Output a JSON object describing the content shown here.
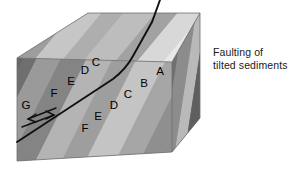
{
  "figure": {
    "kind": "geologic-block-diagram",
    "caption_line_1": "Faulting of",
    "caption_line_2": "tilted sediments",
    "background_color": "#ffffff"
  },
  "block": {
    "top_face_label": "top-face",
    "front_face_label": "front-face",
    "right_face_label": "right-face",
    "outline_color": "#6d6d6d"
  },
  "fault": {
    "line_color": "#111111",
    "arrow_color": "#111111",
    "upper_arrow_direction": "left",
    "lower_arrow_direction": "right"
  },
  "strata_labels": {
    "hanging_wall": [
      {
        "id": "label-c-top",
        "text": "C",
        "x": 96,
        "y": 66
      },
      {
        "id": "label-d-top",
        "text": "D",
        "x": 85,
        "y": 72
      },
      {
        "id": "label-e-top",
        "text": "E",
        "x": 71,
        "y": 83
      },
      {
        "id": "label-f-top",
        "text": "F",
        "x": 54,
        "y": 95
      },
      {
        "id": "label-g-top",
        "text": "G",
        "x": 26,
        "y": 108
      }
    ],
    "footwall": [
      {
        "id": "label-a",
        "text": "A",
        "x": 160,
        "y": 73
      },
      {
        "id": "label-b",
        "text": "B",
        "x": 144,
        "y": 85
      },
      {
        "id": "label-c-low",
        "text": "C",
        "x": 128,
        "y": 96
      },
      {
        "id": "label-d-low",
        "text": "D",
        "x": 114,
        "y": 106
      },
      {
        "id": "label-e-low",
        "text": "E",
        "x": 98,
        "y": 117
      },
      {
        "id": "label-f-low",
        "text": "F",
        "x": 85,
        "y": 130
      }
    ]
  },
  "palette": {
    "top_band_light": "#d5d5d5",
    "top_band_mid": "#b9b9b9",
    "top_band_dark": "#9d9d9d",
    "top_band_pale": "#e2e2e2",
    "front_band_light": "#c8c8c8",
    "front_band_mid": "#a8a8a8",
    "front_band_dark": "#8a8a8a",
    "front_band_darkest": "#6f6f6f",
    "right_face_dark": "#7a7a7a",
    "right_face_darker": "#5e5e5e",
    "text_color": "#1a1a1a"
  }
}
